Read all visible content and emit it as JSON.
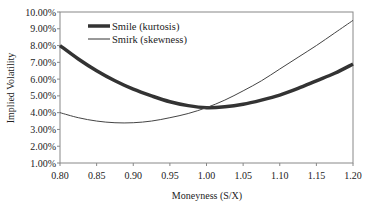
{
  "chart_data": {
    "type": "line",
    "title": "",
    "xlabel": "Moneyness (S/X)",
    "ylabel": "Implied Volatility",
    "xlim": [
      0.8,
      1.2
    ],
    "ylim": [
      0.01,
      0.1
    ],
    "x_ticks": [
      "0.80",
      "0.85",
      "0.90",
      "0.95",
      "1.00",
      "1.05",
      "1.10",
      "1.15",
      "1.20"
    ],
    "y_ticks": [
      "1.00%",
      "2.00%",
      "3.00%",
      "4.00%",
      "5.00%",
      "6.00%",
      "7.00%",
      "8.00%",
      "9.00%",
      "10.00%"
    ],
    "grid": false,
    "legend_position": "upper-left",
    "x": [
      0.8,
      0.825,
      0.85,
      0.875,
      0.9,
      0.925,
      0.95,
      0.975,
      1.0,
      1.025,
      1.05,
      1.075,
      1.1,
      1.125,
      1.15,
      1.175,
      1.2
    ],
    "series": [
      {
        "name": "Smile (kurtosis)",
        "line_width": "thick",
        "values": [
          8.0,
          7.2,
          6.5,
          5.9,
          5.4,
          5.0,
          4.65,
          4.42,
          4.3,
          4.35,
          4.5,
          4.75,
          5.05,
          5.45,
          5.9,
          6.35,
          6.9
        ]
      },
      {
        "name": "Smirk (skewness)",
        "line_width": "thin",
        "values": [
          4.0,
          3.7,
          3.5,
          3.4,
          3.4,
          3.5,
          3.7,
          3.95,
          4.3,
          4.75,
          5.3,
          5.9,
          6.6,
          7.3,
          8.0,
          8.75,
          9.5
        ]
      }
    ]
  }
}
